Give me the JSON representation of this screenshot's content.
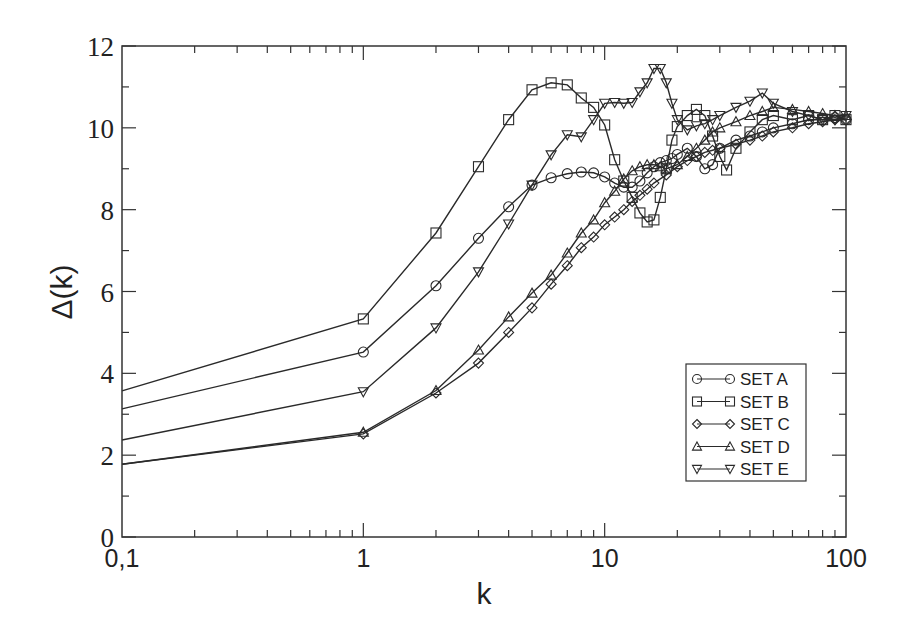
{
  "chart_data": {
    "type": "line",
    "title": "",
    "xlabel": "k",
    "ylabel": "Δ(k)",
    "xscale": "log",
    "xlim": [
      0.1,
      100
    ],
    "ylim": [
      0,
      12
    ],
    "xticks": [
      0.1,
      1,
      10,
      100
    ],
    "xtick_labels": [
      "0,1",
      "1",
      "10",
      "100"
    ],
    "yticks": [
      0,
      2,
      4,
      6,
      8,
      10,
      12
    ],
    "ytick_labels": [
      "0",
      "2",
      "4",
      "6",
      "8",
      "10",
      "12"
    ],
    "grid": false,
    "legend_position": "lower right",
    "series": [
      {
        "name": "SET A",
        "marker": "circle",
        "x": [
          0.1,
          1,
          2,
          3,
          4,
          5,
          6,
          7,
          8,
          9,
          10,
          11,
          12,
          13,
          14,
          15,
          16,
          17,
          18,
          19,
          20,
          22,
          24,
          26,
          28,
          30,
          35,
          40,
          45,
          50,
          60,
          70,
          80,
          90,
          100
        ],
        "values": [
          3.13,
          4.52,
          6.14,
          7.3,
          8.07,
          8.6,
          8.78,
          8.88,
          8.92,
          8.9,
          8.8,
          8.65,
          8.55,
          8.55,
          8.7,
          8.9,
          9.05,
          9.15,
          9.2,
          9.25,
          9.35,
          9.5,
          9.3,
          9.0,
          9.1,
          9.5,
          9.7,
          9.8,
          9.9,
          10.0,
          10.1,
          10.2,
          10.2,
          10.25,
          10.2
        ]
      },
      {
        "name": "SET B",
        "marker": "square",
        "x": [
          0.1,
          1,
          2,
          3,
          4,
          5,
          6,
          7,
          8,
          9,
          10,
          11,
          12,
          13,
          14,
          15,
          16,
          17,
          18,
          19,
          20,
          22,
          24,
          26,
          28,
          30,
          32,
          35,
          40,
          45,
          50,
          60,
          70,
          80,
          90,
          100
        ],
        "values": [
          3.57,
          5.33,
          7.43,
          9.05,
          10.2,
          10.93,
          11.1,
          11.05,
          10.73,
          10.5,
          10.07,
          9.22,
          8.7,
          8.3,
          7.92,
          7.7,
          7.75,
          8.3,
          9.0,
          9.7,
          10.03,
          10.3,
          10.45,
          10.3,
          9.8,
          9.3,
          8.97,
          9.5,
          9.9,
          10.2,
          10.3,
          10.2,
          10.3,
          10.2,
          10.3,
          10.2
        ]
      },
      {
        "name": "SET C",
        "marker": "diamond",
        "x": [
          0.1,
          1,
          2,
          3,
          4,
          5,
          6,
          7,
          8,
          9,
          10,
          11,
          12,
          13,
          14,
          15,
          16,
          18,
          20,
          22,
          24,
          26,
          28,
          30,
          35,
          40,
          45,
          50,
          60,
          70,
          80,
          90,
          100
        ],
        "values": [
          1.78,
          2.52,
          3.52,
          4.25,
          5.0,
          5.6,
          6.18,
          6.63,
          7.07,
          7.33,
          7.63,
          7.82,
          8.0,
          8.2,
          8.35,
          8.5,
          8.65,
          8.85,
          9.05,
          9.2,
          9.3,
          9.4,
          9.45,
          9.5,
          9.6,
          9.7,
          9.8,
          9.9,
          10.0,
          10.1,
          10.15,
          10.2,
          10.2
        ]
      },
      {
        "name": "SET D",
        "marker": "triangle-up",
        "x": [
          0.1,
          1,
          2,
          3,
          4,
          5,
          6,
          7,
          8,
          9,
          10,
          11,
          12,
          13,
          14,
          15,
          16,
          17,
          18,
          20,
          22,
          24,
          26,
          28,
          30,
          35,
          40,
          45,
          50,
          60,
          70,
          80,
          90,
          100
        ],
        "values": [
          1.78,
          2.56,
          3.58,
          4.57,
          5.38,
          5.96,
          6.4,
          6.94,
          7.43,
          7.75,
          8.17,
          8.45,
          8.75,
          8.95,
          9.05,
          9.1,
          9.1,
          9.05,
          9.0,
          9.1,
          9.3,
          9.5,
          9.7,
          9.9,
          10.0,
          10.15,
          10.3,
          10.4,
          10.5,
          10.45,
          10.4,
          10.35,
          10.3,
          10.3
        ]
      },
      {
        "name": "SET E",
        "marker": "triangle-down",
        "x": [
          0.1,
          1,
          2,
          3,
          4,
          5,
          6,
          7,
          8,
          9,
          10,
          11,
          12,
          13,
          14,
          15,
          16,
          17,
          18,
          19,
          20,
          22,
          24,
          26,
          28,
          30,
          35,
          40,
          45,
          50,
          60,
          70,
          80,
          90,
          100
        ],
        "values": [
          2.37,
          3.55,
          5.11,
          6.48,
          7.65,
          8.6,
          9.34,
          9.83,
          9.78,
          10.2,
          10.6,
          10.62,
          10.6,
          10.62,
          10.88,
          11.1,
          11.45,
          11.45,
          11.1,
          10.6,
          10.2,
          9.95,
          10.05,
          10.1,
          10.2,
          10.3,
          10.5,
          10.65,
          10.85,
          10.6,
          10.4,
          10.3,
          10.2,
          10.2,
          10.3
        ]
      }
    ]
  },
  "legend": {
    "items": [
      {
        "label": "SET A",
        "marker": "circle"
      },
      {
        "label": "SET B",
        "marker": "square"
      },
      {
        "label": "SET C",
        "marker": "diamond"
      },
      {
        "label": "SET D",
        "marker": "triangle-up"
      },
      {
        "label": "SET E",
        "marker": "triangle-down"
      }
    ]
  },
  "colors": {
    "line": "#2a2a2a",
    "axis": "#333333",
    "background": "#ffffff"
  }
}
